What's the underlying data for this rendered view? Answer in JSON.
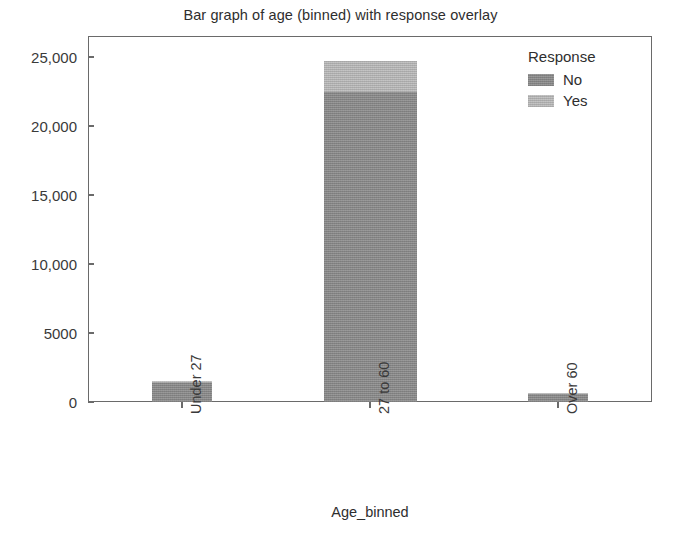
{
  "chart_data": {
    "type": "bar",
    "subtype": "stacked",
    "title": "Bar graph of age (binned) with response overlay",
    "xlabel": "Age_binned",
    "ylabel": "",
    "categories": [
      "Under 27",
      "27 to 60",
      "Over 60"
    ],
    "series": [
      {
        "name": "No",
        "values": [
          1380,
          22450,
          620
        ]
      },
      {
        "name": "Yes",
        "values": [
          150,
          2250,
          30
        ]
      }
    ],
    "totals": [
      1530,
      24700,
      650
    ],
    "ylim": [
      0,
      26500
    ],
    "yticks": [
      0,
      5000,
      10000,
      15000,
      20000,
      25000
    ],
    "ytick_labels": [
      "0",
      "5000",
      "10,000",
      "15,000",
      "20,000",
      "25,000"
    ],
    "grid": false,
    "legend": {
      "title": "Response",
      "position": "top-right",
      "entries": [
        {
          "label": "No",
          "color": "#8e8e8e"
        },
        {
          "label": "Yes",
          "color": "#bdbdbd"
        }
      ]
    },
    "xtick_label_rotation": -90,
    "colors": {
      "no": "#8e8e8e",
      "yes": "#bdbdbd",
      "axis": "#6a6a6a",
      "text": "#2e2e2e",
      "background": "#ffffff"
    }
  }
}
